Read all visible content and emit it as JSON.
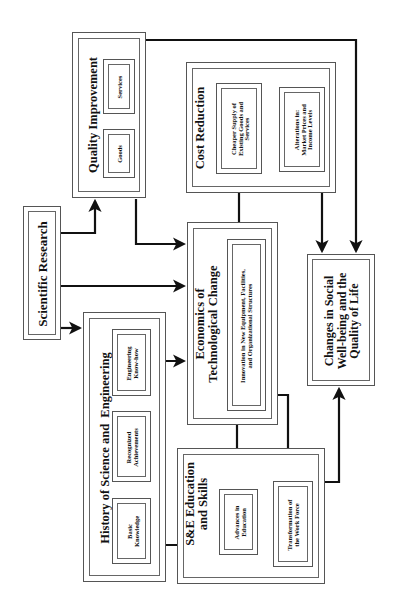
{
  "diagram": {
    "orientation": "rotated-90-ccw",
    "nodes": {
      "scientific_research": "Scientific Research",
      "quality_improvement": {
        "title": "Quality Improvement",
        "items": [
          "Goods",
          "Services"
        ]
      },
      "cost_reduction": {
        "title": "Cost Reduction",
        "items": [
          "Cheaper Supply of\nExisting Goods and\nServices",
          "Alterations in:\nMarket Prices and\nIncome Levels"
        ]
      },
      "history": {
        "title": "History of Science and  Engineering",
        "items": [
          "Basic\nKnowledge",
          "Recognized\nAchievements",
          "Engineering\nKnow-how"
        ]
      },
      "economics": {
        "title": "Economics of\nTechnological Change",
        "inner": "Innovation in New Equipment, Facilities,\nand Organizational Structures"
      },
      "se_education": {
        "title": "S&E Education\nand Skills",
        "items": [
          "Advances in\nEducation",
          "Transformation of\nthe Work Force"
        ]
      },
      "changes": "Changes in Social\nWell-being and the\nQuality of Life"
    },
    "edges": [
      {
        "from": "Scientific Research",
        "to": "Quality Improvement"
      },
      {
        "from": "Scientific Research",
        "to": "Economics of Technological Change"
      },
      {
        "from": "Scientific Research",
        "to": "History of Science and Engineering"
      },
      {
        "from": "Quality Improvement",
        "to": "Economics of Technological Change"
      },
      {
        "from": "Quality Improvement",
        "to": "Changes in Social Well-being and the Quality of Life"
      },
      {
        "from": "Engineering Know-how",
        "to": "Economics of Technological Change"
      },
      {
        "from": "Basic Knowledge",
        "to": "Advances in Education"
      },
      {
        "from": "Innovation in New Equipment, Facilities, and Organizational Structures",
        "to": "Cheaper Supply of Existing Goods and Services"
      },
      {
        "from": "Innovation in New Equipment, Facilities, and Organizational Structures",
        "to": "Advances in Education"
      },
      {
        "from": "Innovation in New Equipment, Facilities, and Organizational Structures",
        "to": "Transformation of the Work Force"
      },
      {
        "from": "Cheaper Supply of Existing Goods and Services",
        "to": "Alterations in: Market Prices and Income Levels"
      },
      {
        "from": "Cost Reduction",
        "to": "Changes in Social Well-being and the Quality of Life"
      },
      {
        "from": "Advances in Education",
        "to": "Transformation of the Work Force"
      },
      {
        "from": "S&E Education and Skills",
        "to": "Changes in Social Well-being and the Quality of Life"
      }
    ]
  }
}
